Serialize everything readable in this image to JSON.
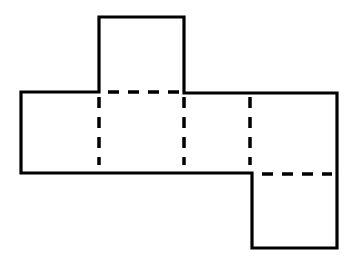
{
  "diagram": {
    "type": "net",
    "stroke_color": "#000000",
    "background": "#ffffff",
    "outline_points": [
      [
        99,
        17
      ],
      [
        184,
        17
      ],
      [
        184,
        93
      ],
      [
        337,
        93
      ],
      [
        337,
        248
      ],
      [
        252,
        248
      ],
      [
        252,
        173
      ],
      [
        21,
        173
      ],
      [
        21,
        92
      ],
      [
        99,
        92
      ]
    ],
    "fold_lines": [
      {
        "from": [
          108,
          92
        ],
        "to": [
          180,
          92
        ]
      },
      {
        "from": [
          99,
          97
        ],
        "to": [
          99,
          163
        ]
      },
      {
        "from": [
          184,
          97
        ],
        "to": [
          184,
          163
        ]
      },
      {
        "from": [
          250,
          97
        ],
        "to": [
          250,
          163
        ]
      },
      {
        "from": [
          262,
          174
        ],
        "to": [
          330,
          174
        ]
      }
    ],
    "faces": [
      {
        "id": "top-flap"
      },
      {
        "id": "left-face"
      },
      {
        "id": "center-face"
      },
      {
        "id": "middle-right-face"
      },
      {
        "id": "right-face"
      },
      {
        "id": "bottom-flap"
      }
    ]
  }
}
